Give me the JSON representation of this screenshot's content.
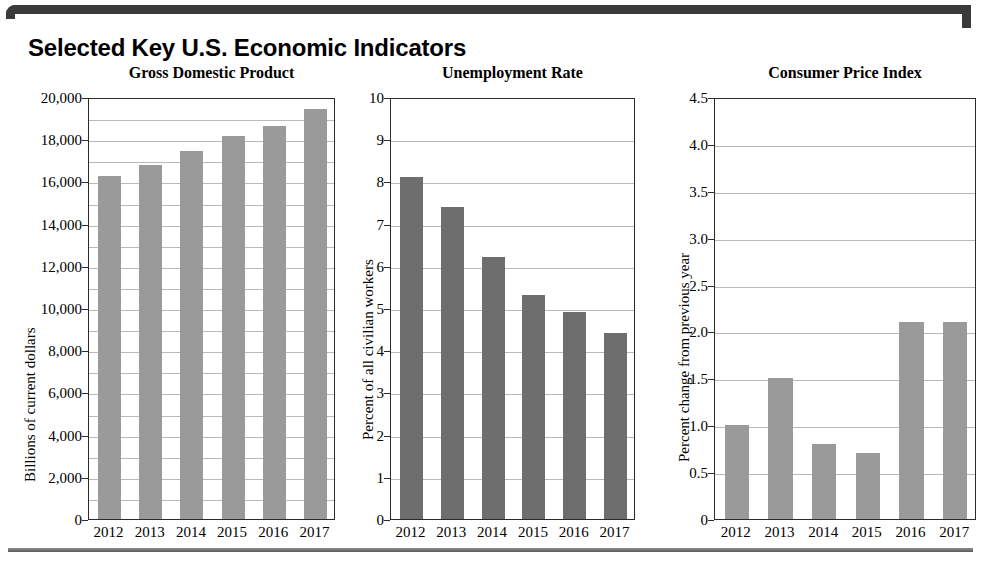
{
  "header": {
    "title": "Selected Key U.S. Economic Indicators"
  },
  "chart_data": [
    {
      "type": "bar",
      "id": "gross-domestic-product",
      "title": "Gross Domestic Product",
      "xlabel": "",
      "ylabel": "Billions of current dollars",
      "categories": [
        "2012",
        "2013",
        "2014",
        "2015",
        "2016",
        "2017"
      ],
      "values": [
        16250,
        16800,
        17450,
        18150,
        18650,
        19450
      ],
      "ylim": [
        0,
        20000
      ],
      "ytick_values": [
        0,
        2000,
        4000,
        6000,
        8000,
        10000,
        12000,
        14000,
        16000,
        18000,
        20000
      ],
      "ytick_labels": [
        "0",
        "2,000",
        "4,000",
        "6,000",
        "8,000",
        "10,000",
        "12,000",
        "14,000",
        "16,000",
        "18,000",
        "20,000"
      ],
      "gridline_step": 1000,
      "grid": true,
      "legend": "none",
      "bar_color": "#9a9a9a"
    },
    {
      "type": "bar",
      "id": "unemployment-rate",
      "title": "Unemployment Rate",
      "xlabel": "",
      "ylabel": "Percent of all civilian workers",
      "categories": [
        "2012",
        "2013",
        "2014",
        "2015",
        "2016",
        "2017"
      ],
      "values": [
        8.1,
        7.4,
        6.2,
        5.3,
        4.9,
        4.4
      ],
      "ylim": [
        0,
        10
      ],
      "ytick_values": [
        0,
        1,
        2,
        3,
        4,
        5,
        6,
        7,
        8,
        9,
        10
      ],
      "ytick_labels": [
        "0",
        "1",
        "2",
        "3",
        "4",
        "5",
        "6",
        "7",
        "8",
        "9",
        "10"
      ],
      "gridline_step": 1,
      "grid": true,
      "legend": "none",
      "bar_color": "#6e6e6e"
    },
    {
      "type": "bar",
      "id": "consumer-price-index",
      "title": "Consumer Price Index",
      "xlabel": "",
      "ylabel": "Percent change from previous year",
      "categories": [
        "2012",
        "2013",
        "2014",
        "2015",
        "2016",
        "2017"
      ],
      "values": [
        1.0,
        1.5,
        0.8,
        0.7,
        2.1,
        2.1
      ],
      "ylim": [
        0,
        4.5
      ],
      "ytick_values": [
        0,
        0.5,
        1.0,
        1.5,
        2.0,
        2.5,
        3.0,
        3.5,
        4.0,
        4.5
      ],
      "ytick_labels": [
        "0",
        "0.5",
        "1.0",
        "1.5",
        "2.0",
        "2.5",
        "3.0",
        "3.5",
        "4.0",
        "4.5"
      ],
      "gridline_step": 0.5,
      "grid": true,
      "legend": "none",
      "bar_color": "#9a9a9a"
    }
  ]
}
